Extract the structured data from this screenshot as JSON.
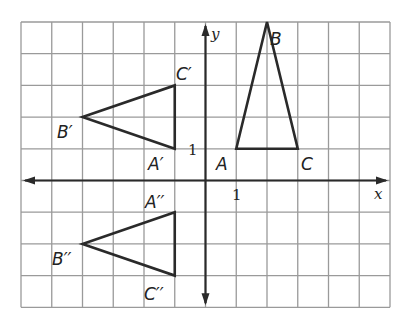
{
  "diagram": {
    "type": "coordinate-plane-transformations",
    "grid": {
      "x_min": -6,
      "x_max": 6,
      "y_min": -4,
      "y_max": 5,
      "left_px": 21,
      "top_px": 22,
      "cell_w": 30.75,
      "cell_h": 31.7,
      "grid_color": "#9a9a9a",
      "axis_color": "#2a2a2a"
    },
    "axes": {
      "x_label": "x",
      "y_label": "y",
      "x_tick_label": "1",
      "y_tick_label": "1"
    },
    "figures": [
      {
        "name": "ABC",
        "points": [
          {
            "label": "A",
            "x": 1,
            "y": 1
          },
          {
            "label": "B",
            "x": 2,
            "y": 5
          },
          {
            "label": "C",
            "x": 3,
            "y": 1
          }
        ]
      },
      {
        "name": "A'B'C'",
        "points": [
          {
            "label": "A'",
            "x": -1,
            "y": 1
          },
          {
            "label": "B'",
            "x": -4,
            "y": 2
          },
          {
            "label": "C'",
            "x": -1,
            "y": 3
          }
        ]
      },
      {
        "name": "A''B''C''",
        "points": [
          {
            "label": "A''",
            "x": -1,
            "y": -1
          },
          {
            "label": "B''",
            "x": -4,
            "y": -2
          },
          {
            "label": "C''",
            "x": -1,
            "y": -3
          }
        ]
      }
    ],
    "labels": {
      "A": "A",
      "B": "B",
      "C": "C",
      "A1": "A′",
      "B1": "B′",
      "C1": "C′",
      "A2": "A′′",
      "B2": "B′′",
      "C2": "C′′"
    }
  }
}
